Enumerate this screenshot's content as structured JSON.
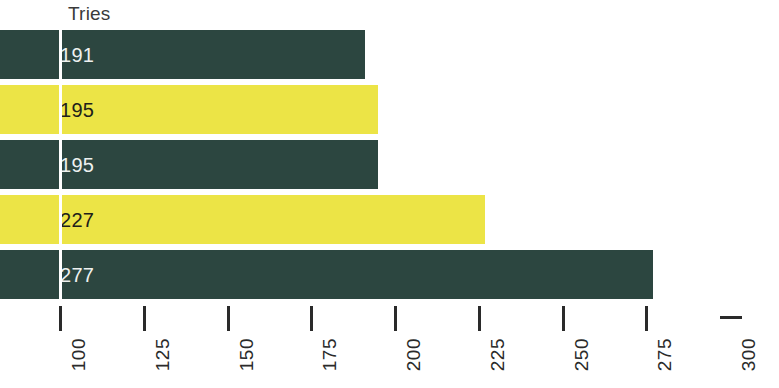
{
  "chart_data": {
    "type": "bar",
    "orientation": "horizontal",
    "title": "Tries",
    "xlabel": "",
    "ylabel": "",
    "xlim": [
      100,
      300
    ],
    "grid": false,
    "legend": null,
    "categories": [
      "",
      "",
      "",
      "",
      ""
    ],
    "values": [
      191,
      195,
      195,
      227,
      277
    ],
    "data_labels": [
      "191",
      "195",
      "195",
      "227",
      "277"
    ],
    "tick_labels": [
      "100",
      "125",
      "150",
      "175",
      "200",
      "225",
      "250",
      "275",
      "300"
    ],
    "tick_values": [
      100,
      125,
      150,
      175,
      200,
      225,
      250,
      275,
      300
    ],
    "bar_colors": [
      "#2c4640",
      "#ece446",
      "#2c4640",
      "#ece446",
      "#2c4640"
    ],
    "palette": {
      "dark": "#2c4640",
      "yellow": "#ece446",
      "background": "#ffffff",
      "axis": "#2a2a2a",
      "title_text": "#3a3a3a",
      "label_on_dark": "#eef1f0",
      "label_on_yellow": "#20201a"
    }
  }
}
